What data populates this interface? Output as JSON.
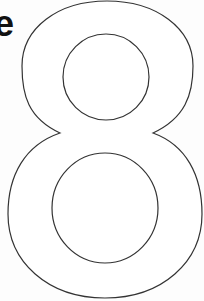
{
  "letter": {
    "text": "e",
    "color": "#111111"
  },
  "digit": {
    "glyph": "8",
    "style": "outline",
    "stroke_color": "#333333",
    "fill_color": "#ffffff"
  }
}
